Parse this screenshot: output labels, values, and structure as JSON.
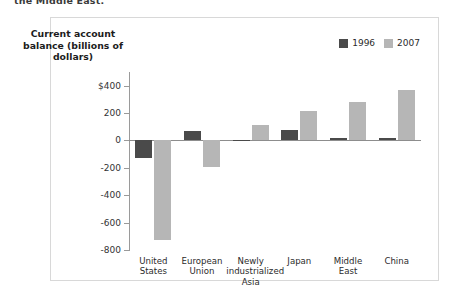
{
  "caption": {
    "text": "the Middle East."
  },
  "axis_title": "Current account balance (billions of dollars)",
  "legend": {
    "items": [
      {
        "label": "1996",
        "color": "#4a4a4a",
        "swatch_name": "legend-swatch-1996"
      },
      {
        "label": "2007",
        "color": "#b6b6b6",
        "swatch_name": "legend-swatch-2007"
      }
    ]
  },
  "chart_data": {
    "type": "bar",
    "title": "",
    "xlabel": "",
    "ylabel": "Current account balance (billions of dollars)",
    "categories": [
      "United States",
      "European Union",
      "Newly industrialized Asia",
      "Japan",
      "Middle East",
      "China"
    ],
    "series": [
      {
        "name": "1996",
        "color": "#4a4a4a",
        "values": [
          -125,
          70,
          5,
          75,
          20,
          20
        ]
      },
      {
        "name": "2007",
        "color": "#b6b6b6",
        "values": [
          -730,
          -195,
          110,
          215,
          280,
          370
        ]
      }
    ],
    "ylim": [
      -800,
      500
    ],
    "yticks": [
      400,
      200,
      0,
      -200,
      -400,
      -600,
      -800
    ],
    "ytick_labels": [
      "$400",
      "200",
      "0",
      "-200",
      "-400",
      "-600",
      "-800"
    ],
    "grid": false,
    "legend_position": "top-right",
    "zero_line": true
  }
}
